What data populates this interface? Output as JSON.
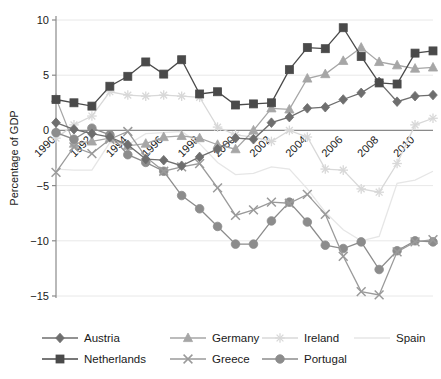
{
  "chart_data": {
    "type": "line",
    "title": "",
    "xlabel": "",
    "ylabel": "Percentage of GDP",
    "xlim": [
      1990,
      2011
    ],
    "ylim": [
      -15,
      10
    ],
    "yticks": [
      10,
      5,
      0,
      -5,
      -10,
      -15
    ],
    "ytick_labels": [
      "10",
      "5",
      "0",
      "−5",
      "−10",
      "−15"
    ],
    "xticks": [
      1990,
      1992,
      1994,
      1996,
      1998,
      2000,
      2002,
      2004,
      2006,
      2008,
      2010
    ],
    "xtick_labels": [
      "1990",
      "1992",
      "1994",
      "1996",
      "1998",
      "2000",
      "2002",
      "2004",
      "2006",
      "2008",
      "2010"
    ],
    "grid": true,
    "legend_position": "bottom",
    "x": [
      1990,
      1991,
      1992,
      1993,
      1994,
      1995,
      1996,
      1997,
      1998,
      1999,
      2000,
      2001,
      2002,
      2003,
      2004,
      2005,
      2006,
      2007,
      2008,
      2009,
      2010,
      2011
    ],
    "series": [
      {
        "name": "Austria",
        "marker": "diamond",
        "color": "#6e6e6e",
        "values": [
          0.7,
          0.1,
          -0.3,
          -0.6,
          -1.3,
          -2.6,
          -2.7,
          -3.2,
          -2.4,
          -1.7,
          -0.7,
          -0.8,
          0.7,
          1.2,
          2.0,
          2.1,
          2.8,
          3.4,
          4.4,
          2.6,
          3.1,
          3.2
        ]
      },
      {
        "name": "Germany",
        "marker": "triangle",
        "color": "#a6a6a6",
        "values": [
          2.9,
          -1.2,
          -1.0,
          -0.7,
          -1.4,
          -1.2,
          -0.6,
          -0.5,
          -0.7,
          -1.3,
          -1.7,
          0.0,
          2.0,
          1.9,
          4.7,
          5.1,
          6.3,
          7.5,
          6.2,
          5.9,
          5.6,
          5.7
        ]
      },
      {
        "name": "Ireland",
        "marker": "star",
        "color": "#d8d8d8",
        "values": [
          -0.7,
          0.5,
          1.3,
          3.5,
          3.2,
          3.1,
          3.2,
          3.1,
          3.0,
          0.3,
          -0.4,
          -0.6,
          -1.0,
          0.0,
          -0.6,
          -3.5,
          -3.6,
          -5.3,
          -5.6,
          -3.0,
          0.5,
          1.1
        ]
      },
      {
        "name": "Spain",
        "marker": "none",
        "color": "#e6e6e6",
        "values": [
          -3.5,
          -3.6,
          -3.6,
          -1.1,
          -1.3,
          -0.3,
          -0.2,
          -0.1,
          -1.2,
          -2.9,
          -4.0,
          -3.9,
          -3.3,
          -3.5,
          -5.3,
          -7.4,
          -9.0,
          -10.0,
          -9.6,
          -4.8,
          -4.5,
          -3.7
        ]
      },
      {
        "name": "Netherlands",
        "marker": "square",
        "color": "#4a4a4a",
        "values": [
          2.8,
          2.5,
          2.2,
          4.0,
          4.9,
          6.2,
          5.1,
          6.4,
          3.3,
          3.5,
          2.3,
          2.4,
          2.5,
          5.5,
          7.5,
          7.4,
          9.3,
          6.7,
          4.3,
          4.2,
          7.0,
          7.2
        ]
      },
      {
        "name": "Greece",
        "marker": "x",
        "color": "#9a9a9a",
        "values": [
          -3.8,
          -1.5,
          -2.1,
          -0.8,
          -0.1,
          -2.4,
          -3.7,
          -3.3,
          -3.0,
          -5.2,
          -7.7,
          -7.2,
          -6.5,
          -6.6,
          -5.8,
          -7.6,
          -11.4,
          -14.6,
          -14.9,
          -11.0,
          -10.1,
          -9.9
        ]
      },
      {
        "name": "Portugal",
        "marker": "circle",
        "color": "#8c8c8c",
        "values": [
          -0.2,
          -0.8,
          0.2,
          -0.4,
          -2.2,
          -2.9,
          -3.7,
          -5.9,
          -7.1,
          -8.7,
          -10.3,
          -10.3,
          -8.2,
          -6.5,
          -8.3,
          -10.4,
          -10.7,
          -10.1,
          -12.6,
          -10.9,
          -10.0,
          -10.1
        ]
      }
    ]
  },
  "axis": {
    "ylabel": "Percentage of GDP"
  },
  "legend": {
    "entries": [
      {
        "label": "Austria",
        "marker": "diamond",
        "color": "#6e6e6e"
      },
      {
        "label": "Germany",
        "marker": "triangle",
        "color": "#a6a6a6"
      },
      {
        "label": "Ireland",
        "marker": "star",
        "color": "#d8d8d8"
      },
      {
        "label": "Spain",
        "marker": "none",
        "color": "#e6e6e6"
      },
      {
        "label": "Netherlands",
        "marker": "square",
        "color": "#4a4a4a"
      },
      {
        "label": "Greece",
        "marker": "x",
        "color": "#9a9a9a"
      },
      {
        "label": "Portugal",
        "marker": "circle",
        "color": "#8c8c8c"
      }
    ]
  }
}
